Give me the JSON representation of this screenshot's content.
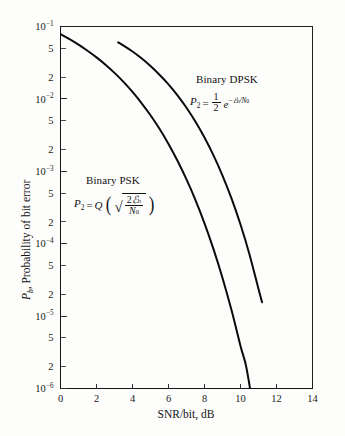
{
  "chart_data": {
    "type": "line",
    "title": "",
    "xlabel": "SNR/bit, dB",
    "ylabel": "P_b, Probability of bit error",
    "xlim": [
      0,
      14
    ],
    "ylim": [
      1e-06,
      0.1
    ],
    "yscale": "log",
    "grid": false,
    "legend_position": "inline-annotation",
    "x_ticks": [
      0,
      2,
      4,
      6,
      8,
      10,
      12,
      14
    ],
    "x_tick_labels": [
      "0",
      "2",
      "4",
      "6",
      "8",
      "10",
      "12",
      "14"
    ],
    "y_major_ticks": [
      0.1,
      0.01,
      0.001,
      0.0001,
      1e-05,
      1e-06
    ],
    "y_major_labels": [
      "10^-1",
      "10^-2",
      "10^-3",
      "10^-4",
      "10^-5",
      "10^-6"
    ],
    "y_minor_labels": [
      "5",
      "2"
    ],
    "series": [
      {
        "name": "Binary PSK",
        "formula": "P_2 = Q(sqrt(2 E_b / N_0))",
        "x": [
          0,
          0.5,
          1,
          1.5,
          2,
          2.5,
          3,
          3.5,
          4,
          4.5,
          5,
          5.5,
          6,
          6.5,
          7,
          7.5,
          8,
          8.5,
          9,
          9.5,
          10,
          10.3,
          10.53
        ],
        "values": [
          0.0786,
          0.0671,
          0.0563,
          0.0463,
          0.0375,
          0.0297,
          0.0229,
          0.0172,
          0.0125,
          0.00877,
          0.00595,
          0.00387,
          0.00239,
          0.0014,
          0.000773,
          0.0004,
          0.000191,
          8.4e-05,
          3.36e-05,
          1.21e-05,
          3.87e-06,
          2.1e-06,
          1e-06
        ]
      },
      {
        "name": "Binary DPSK",
        "formula": "P_2 = (1/2) e^(-E_b / N_0)",
        "x": [
          3.2,
          3.5,
          4,
          4.5,
          5,
          5.5,
          6,
          6.5,
          7,
          7.5,
          8,
          8.5,
          9,
          9.5,
          10,
          10.5,
          11,
          11.2
        ],
        "values": [
          0.0605,
          0.0545,
          0.0452,
          0.0364,
          0.0285,
          0.0216,
          0.0159,
          0.0112,
          0.00755,
          0.00484,
          0.00293,
          0.00166,
          0.000874,
          0.000422,
          0.000184,
          7.11e-05,
          2.37e-05,
          1.55e-05
        ]
      }
    ]
  },
  "annotations": {
    "dpsk": {
      "label": "Binary DPSK",
      "formula_lhs": "P",
      "formula_lhs_sub": "2",
      "formula_eq": "=",
      "frac_num": "1",
      "frac_den": "2",
      "exp_base": "e",
      "exp_sup_minus": "−",
      "exp_sup_script": "ℰ",
      "exp_sup_script_sub": "b",
      "exp_sup_div": "/N",
      "exp_sup_div_sub": "0"
    },
    "psk": {
      "label": "Binary PSK",
      "formula_lhs": "P",
      "formula_lhs_sub": "2",
      "formula_eq": "=",
      "q_symbol": "Q",
      "paren_open": "(",
      "paren_close": ")",
      "radical": "√",
      "frac_num_coef": "2",
      "frac_num_script": "ℰ",
      "frac_num_script_sub": "b",
      "frac_den_symbol": "N",
      "frac_den_sub": "0"
    }
  },
  "axes": {
    "x_title": "SNR/bit, dB",
    "y_title_symbol": "P",
    "y_title_symbol_sub": "b",
    "y_title_rest": ", Probability of bit error",
    "x_tick_labels": [
      "0",
      "2",
      "4",
      "6",
      "8",
      "10",
      "12",
      "14"
    ],
    "y_decade_mantissa": "10",
    "y_decade_exponents": [
      "−1",
      "−2",
      "−3",
      "−4",
      "−5",
      "−6"
    ],
    "y_minor_5": "5",
    "y_minor_2": "2"
  },
  "colors": {
    "curve": "#0b0b0b",
    "axis": "#151515",
    "text": "#141414",
    "background": "#fdfdfc"
  }
}
